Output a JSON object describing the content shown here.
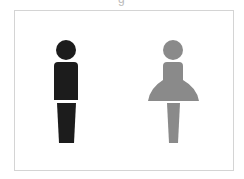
{
  "image": {
    "top_fragment_text": "g",
    "figures": [
      {
        "name": "male",
        "color": "#1c1c1c"
      },
      {
        "name": "female",
        "color": "#8a8a8a"
      }
    ],
    "frame_border_color": "#d4d4d4"
  }
}
